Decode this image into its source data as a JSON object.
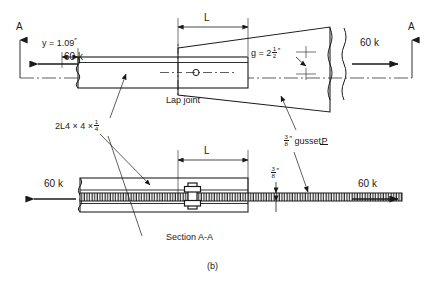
{
  "figure": {
    "caption": "(b)",
    "title_top": "Lap joint",
    "title_bottom": "Section A-A"
  },
  "section_marks": {
    "left": "A",
    "right": "A"
  },
  "dimensions": {
    "L_top": "L",
    "L_bottom": "L",
    "eccentricity": {
      "text": "y = 1.09",
      "unit_mark": "″"
    },
    "gage": {
      "prefix": "g = 2",
      "num": "1",
      "den": "2",
      "unit_mark": "″"
    },
    "gusset_thickness_callout": {
      "num": "3",
      "den": "8",
      "unit_mark": "″",
      "label": "gusset",
      "plate_symbol": "P"
    },
    "plate_thickness_section": {
      "num": "3",
      "den": "8",
      "unit_mark": "″"
    }
  },
  "members": {
    "angles": {
      "prefix": "2L4",
      "x1": "×",
      "leg": "4",
      "x2": "×",
      "num": "1",
      "den": "4"
    }
  },
  "loads": {
    "top_left": "60 k",
    "top_right": "60 k",
    "bottom_left": "60 k",
    "bottom_right": "60 k"
  },
  "colors": {
    "line": "#1a1a1a",
    "background": "#ffffff",
    "hatch": "#1a1a1a"
  }
}
